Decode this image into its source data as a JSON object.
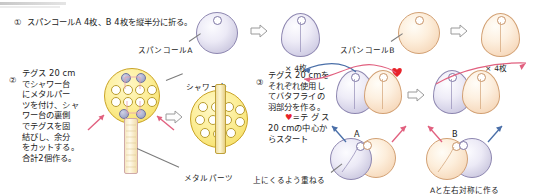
{
  "doc": {
    "title": "スパンコール バタフライ 作り方 手順図",
    "language": "ja"
  },
  "steps": [
    {
      "number": "①",
      "text": "スパンコールA 4枚、B 4枚を縦半分に折る。",
      "labels": {
        "spangle_a": "スパンコールA",
        "spangle_b": "スパンコールB",
        "count_a": "× 4枚",
        "count_b": "× 4枚"
      }
    },
    {
      "number": "②",
      "lines": [
        "テグス 20 cm",
        "でシャワー台",
        "にメタルパー",
        "ツを付け、シャ",
        "ワー台の裏側",
        "でテグスを固",
        "結びし、余分",
        "をカットする。",
        "合計2個作る。"
      ],
      "labels": {
        "shower_base": "シャワー台",
        "metal_parts": "メタルパーツ"
      }
    },
    {
      "number": "③",
      "lines": [
        "テグス 20 cmを",
        "それぞれ使用し",
        "てバタフライの",
        "羽部分を作る。",
        "♥=テ グ ス",
        "20 cmの中心か",
        "らスタート"
      ],
      "heart_symbol": "♥",
      "labels": {
        "wing_a": "A",
        "wing_b": "B",
        "overlap_note": "上にくるよう重ねる",
        "mirror_note": "Aと左右対称に作る"
      }
    }
  ],
  "colors": {
    "spangle_a": "#d2cfe4",
    "spangle_b": "#f7dcc0",
    "shower_base": "#f7e271",
    "metal_parts": "#e6cf86",
    "heart": "#e8232a",
    "thread_blue": "#4a6fa8",
    "thread_pink": "#e1607f",
    "arrow_outline": "#9a9a9a",
    "text": "#1b1b1b"
  }
}
